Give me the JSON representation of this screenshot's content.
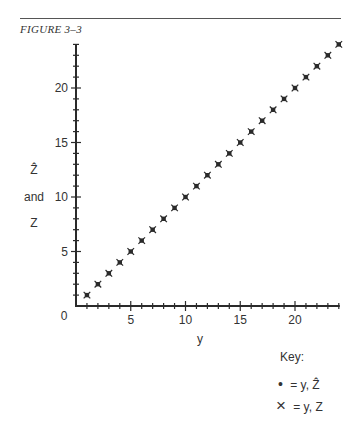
{
  "figure": {
    "title": "FIGURE 3–3"
  },
  "axes": {
    "ylabel_line1": "Ẑ",
    "ylabel_line1_display": "Ẑ",
    "ylabel_line2": "and",
    "ylabel_line3": "Z",
    "xlabel": "y",
    "origin_label": "0",
    "xticks": [
      "5",
      "10",
      "15",
      "20"
    ],
    "yticks": [
      "5",
      "10",
      "15",
      "20"
    ]
  },
  "key": {
    "title": "Key:",
    "entries": [
      {
        "symbol": "•",
        "label": "= y, Ẑ"
      },
      {
        "symbol": "×",
        "label": "= y, Z"
      }
    ]
  },
  "colors": {
    "ink": "#2a2a2a",
    "background": "#ffffff"
  },
  "chart_data": {
    "type": "scatter",
    "title": "FIGURE 3–3",
    "xlabel": "y",
    "ylabel": "Ẑ and Z",
    "xlim": [
      0,
      24
    ],
    "ylim": [
      0,
      24
    ],
    "grid": false,
    "legend_position": "bottom-right",
    "series": [
      {
        "name": "y, Ẑ",
        "marker": "dot",
        "x": [
          1,
          2,
          3,
          4,
          5,
          6,
          7,
          8,
          9,
          10,
          11,
          12,
          13,
          14,
          15,
          16,
          17,
          18,
          19,
          20,
          21,
          22,
          23,
          24
        ],
        "y": [
          1,
          2,
          3,
          4,
          5,
          6,
          7,
          8,
          9,
          10,
          11,
          12,
          13,
          14,
          15,
          16,
          17,
          18,
          19,
          20,
          21,
          22,
          23,
          24
        ]
      },
      {
        "name": "y, Z",
        "marker": "x",
        "x": [
          1,
          2,
          3,
          4,
          5,
          6,
          7,
          8,
          9,
          10,
          11,
          12,
          13,
          14,
          15,
          16,
          17,
          18,
          19,
          20,
          21,
          22,
          23,
          24
        ],
        "y": [
          1,
          2,
          3,
          4,
          5,
          6,
          7,
          8,
          9,
          10,
          11,
          12,
          13,
          14,
          15,
          16,
          17,
          18,
          19,
          20,
          21,
          22,
          23,
          24
        ]
      }
    ]
  }
}
